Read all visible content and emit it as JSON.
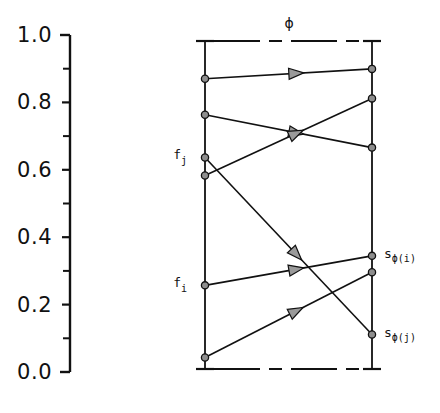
{
  "figure": {
    "title": "",
    "permutation_symbol": "ϕ"
  },
  "axis": {
    "orientation": "vertical",
    "labels": [
      "1.0",
      "0.8",
      "0.6",
      "0.4",
      "0.2",
      "0.0"
    ],
    "label_values": [
      1.0,
      0.8,
      0.6,
      0.4,
      0.2,
      0.0
    ],
    "minor_tick_values": [
      0.9,
      0.7,
      0.5,
      0.3,
      0.1
    ],
    "range": [
      0.0,
      1.0
    ]
  },
  "columns": {
    "left": {
      "name": "f",
      "labels": [
        {
          "id": "f_j",
          "base": "f",
          "sub": "j",
          "value": 0.645
        },
        {
          "id": "f_i",
          "base": "f",
          "sub": "i",
          "value": 0.255
        }
      ]
    },
    "right": {
      "name": "s",
      "labels": [
        {
          "id": "s_phi_i",
          "base": "s",
          "sub": "ϕ(i)",
          "value": 0.345
        },
        {
          "id": "s_phi_j",
          "base": "s",
          "sub": "ϕ(j)",
          "value": 0.105
        }
      ]
    }
  },
  "chart_data": {
    "type": "scatter",
    "title": "",
    "xlabel": "",
    "ylabel": "",
    "ylim": [
      0.0,
      1.0
    ],
    "grid": false,
    "legend": null,
    "annotations": [
      "ϕ",
      "f_j",
      "f_i",
      "s_ϕ(i)",
      "s_ϕ(j)"
    ],
    "series": [
      {
        "name": "left-column-nodes",
        "x": 0,
        "values": [
          0.885,
          0.775,
          0.645,
          0.59,
          0.255,
          0.035
        ]
      },
      {
        "name": "right-column-nodes",
        "x": 1,
        "values": [
          0.915,
          0.825,
          0.675,
          0.345,
          0.295,
          0.105
        ]
      }
    ],
    "edges": [
      {
        "from": 0.885,
        "to": 0.915,
        "direction": "right"
      },
      {
        "from": 0.775,
        "to": 0.675,
        "direction": "right"
      },
      {
        "from": 0.59,
        "to": 0.825,
        "direction": "right"
      },
      {
        "from": 0.645,
        "to": 0.105,
        "direction": "right"
      },
      {
        "from": 0.255,
        "to": 0.345,
        "direction": "right"
      },
      {
        "from": 0.035,
        "to": 0.295,
        "direction": "right"
      }
    ]
  }
}
